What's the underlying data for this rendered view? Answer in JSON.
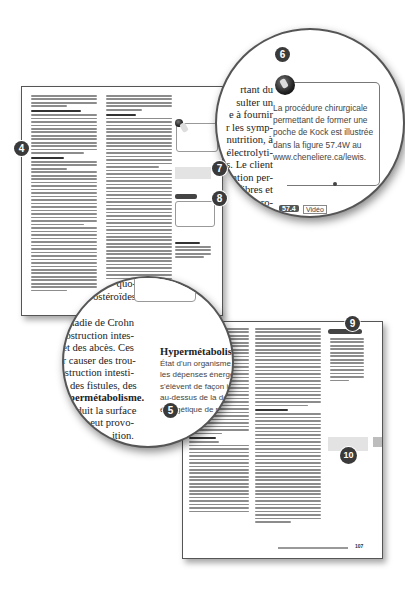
{
  "badges": {
    "b4": "4",
    "b5": "5",
    "b6": "6",
    "b7": "7",
    "b8": "8",
    "b9": "9",
    "b10": "10"
  },
  "magnifier_top": {
    "body_lines": [
      "rtant du",
      "sulter un",
      "e à fournir",
      "r les symp-",
      "nutrition, à",
      "électrolyti-",
      "s. Le client",
      "ation per-",
      "fibres et",
      "de pro-",
      "n ce"
    ],
    "callout_lines": [
      "La procédure chirurgicale",
      "permettant de former une",
      "poche de Kock est illustrée",
      "dans la figure 57.4W au",
      "www.cheneliere.ca/lewis."
    ],
    "icon": "video-camera-icon",
    "footer_tag": "57.4",
    "footer_label": "Vidéo"
  },
  "magnifier_bottom": {
    "top_lines": [
      "quo-",
      "ostéroïdes"
    ],
    "body_lines": [
      "maladie de Crohn",
      "obstruction intes-",
      "s et des abcès. Ces",
      "our causer des trou-",
      "obstruction intesti-",
      "que des fistules, des",
      "l'hypermétabolisme.",
      "ion réduit la surface",
      "tion et peut provo-",
      "ition.",
      "mentaires uni-",
      "ue certains",
      "miner"
    ],
    "glossary_term": "Hypermétabolisme :",
    "glossary_lines": [
      "État d'un organisme dont",
      "les dépenses énergétiques",
      "s'élèvent de façon importante",
      "au-dessus de la dépense",
      "énergétique de repos."
    ]
  },
  "page_b": {
    "footer_chapter": "Chapitre 57",
    "footer_page": "107"
  }
}
